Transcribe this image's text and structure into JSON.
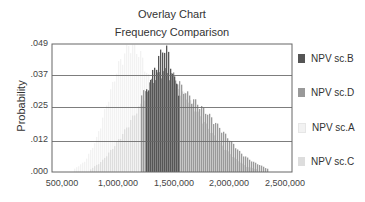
{
  "chart_data": {
    "type": "bar",
    "subtype": "overlay-histogram",
    "title": "Overlay Chart",
    "subtitle": "Frequency Comparison",
    "xlabel": "",
    "ylabel": "Probability",
    "xlim": [
      410000,
      2560000
    ],
    "ylim": [
      0,
      0.049
    ],
    "x_ticks": [
      "500,000",
      "1,000,000",
      "1,500,000",
      "2,000,000",
      "2,500,000"
    ],
    "x_tick_values": [
      500000,
      1000000,
      1500000,
      2000000,
      2500000
    ],
    "y_ticks": [
      ".049",
      ".037",
      ".025",
      ".012",
      ".000"
    ],
    "y_tick_values": [
      0.049,
      0.037,
      0.025,
      0.012,
      0.0
    ],
    "grid": "horizontal",
    "legend_position": "right",
    "series": [
      {
        "name": "NPV sc.B",
        "color": "#555555",
        "x": [
          1250000,
          1300000,
          1350000,
          1400000,
          1425000,
          1450000,
          1500000,
          1550000
        ],
        "values": [
          0.03,
          0.036,
          0.042,
          0.046,
          0.047,
          0.044,
          0.035,
          0.03
        ]
      },
      {
        "name": "NPV sc.D",
        "color": "#999999",
        "x": [
          1200000,
          1300000,
          1400000,
          1500000,
          1600000,
          1700000,
          1800000,
          1900000,
          2000000,
          2100000,
          2200000,
          2300000,
          2350000
        ],
        "values": [
          0.028,
          0.034,
          0.038,
          0.036,
          0.03,
          0.026,
          0.022,
          0.017,
          0.012,
          0.007,
          0.004,
          0.002,
          0.001
        ]
      },
      {
        "name": "NPV sc.A",
        "color": "#f2f2f2",
        "x": [
          600000,
          700000,
          800000,
          900000,
          1000000,
          1100000,
          1200000,
          1300000,
          1400000,
          1500000,
          1600000
        ],
        "values": [
          0.001,
          0.004,
          0.012,
          0.026,
          0.04,
          0.048,
          0.044,
          0.032,
          0.018,
          0.007,
          0.002
        ]
      },
      {
        "name": "NPV sc.C",
        "color": "#dddddd",
        "x": [
          750000,
          850000,
          950000,
          1050000,
          1150000,
          1250000,
          1350000,
          1450000,
          1550000,
          1650000,
          1750000,
          1850000,
          1950000,
          2050000,
          2150000,
          2250000
        ],
        "values": [
          0.001,
          0.004,
          0.009,
          0.015,
          0.022,
          0.028,
          0.032,
          0.033,
          0.031,
          0.026,
          0.02,
          0.014,
          0.009,
          0.005,
          0.002,
          0.001
        ]
      }
    ]
  },
  "legend": {
    "items": [
      {
        "label": "NPV sc.B",
        "color": "#555555"
      },
      {
        "label": "NPV sc.D",
        "color": "#999999"
      },
      {
        "label": "NPV sc.A",
        "color": "#f2f2f2"
      },
      {
        "label": "NPV sc.C",
        "color": "#dddddd"
      }
    ]
  }
}
